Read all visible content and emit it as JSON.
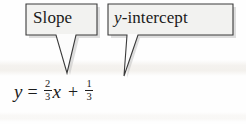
{
  "figure": {
    "type": "annotated-equation-diagram"
  },
  "callouts": [
    {
      "id": "slope",
      "label": "Slope",
      "points_to": "2/3",
      "tail_shape": "narrow-v-down"
    },
    {
      "id": "y-intercept",
      "label_prefix": "y",
      "label_suffix": "-intercept",
      "label": "y-intercept",
      "points_to": "1/3",
      "tail_shape": "diagonal-down-left"
    }
  ],
  "equation": {
    "text": "y = 2/3 x + 1/3",
    "lhs": "y",
    "equals": "=",
    "slope": {
      "numerator": "2",
      "denominator": "3"
    },
    "variable": "x",
    "plus": "+",
    "intercept": {
      "numerator": "1",
      "denominator": "3"
    }
  },
  "colors": {
    "background": "#fefefe",
    "ink": "#1c1c1c",
    "box_fill": "#f2f2f0",
    "box_stroke": "#3b3b3b",
    "shadow": "#b9b9b9"
  }
}
